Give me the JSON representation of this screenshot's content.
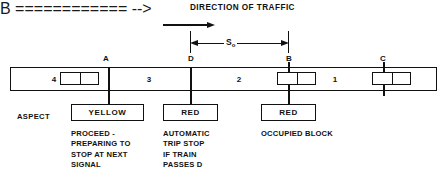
{
  "diagram": {
    "title": "DIRECTION OF TRAFFIC",
    "direction_arrow_icon": "arrow-right-icon",
    "dimension": {
      "symbol": "S",
      "subscript": "o",
      "from_node": "D",
      "to_node": "B",
      "left_arrow_icon": "arrow-left-icon",
      "right_arrow_icon": "arrow-right-icon"
    },
    "aspect_row_label": "ASPECT",
    "nodes": [
      {
        "id": "node-a",
        "letter": "A"
      },
      {
        "id": "node-d",
        "letter": "D"
      },
      {
        "id": "node-b",
        "letter": "B"
      },
      {
        "id": "node-c",
        "letter": "C"
      }
    ],
    "blocks": [
      {
        "id": "block-4",
        "number": "4"
      },
      {
        "id": "block-3",
        "number": "3"
      },
      {
        "id": "block-2",
        "number": "2"
      },
      {
        "id": "block-1",
        "number": "1"
      }
    ],
    "signals": [
      {
        "id": "signal-a",
        "at_node": "A",
        "aspect": "YELLOW",
        "description": "PROCEED -\nPREPARING TO\nSTOP AT NEXT\nSIGNAL"
      },
      {
        "id": "signal-d",
        "at_node": "D",
        "aspect": "RED",
        "description": "AUTOMATIC\nTRIP STOP\nIF TRAIN\nPASSES D"
      },
      {
        "id": "signal-b",
        "at_node": "B",
        "aspect": "RED",
        "description": "OCCUPIED BLOCK"
      }
    ],
    "colors": {
      "ink": "#111111",
      "background": "#ffffff"
    }
  }
}
